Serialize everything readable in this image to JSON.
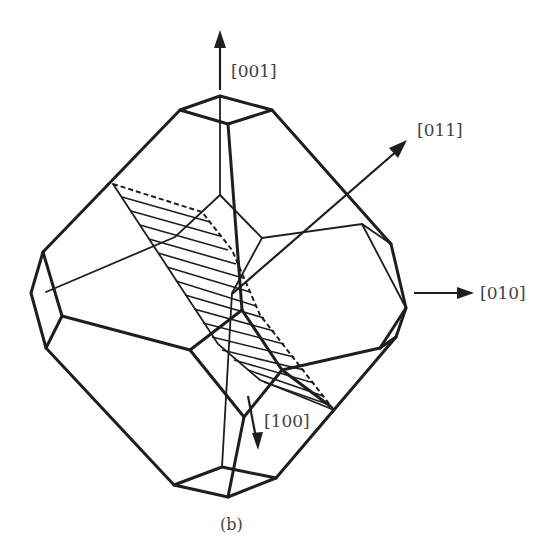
{
  "figure": {
    "caption": "(b)",
    "axes": {
      "a001": "[001]",
      "a011": "[011]",
      "a010": "[010]",
      "a100": "[100]"
    },
    "colors": {
      "line": "#1e1e1e",
      "label": "#444444",
      "background": "#ffffff"
    }
  }
}
